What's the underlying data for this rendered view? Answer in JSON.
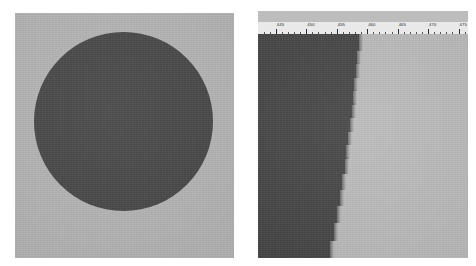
{
  "figure": {
    "title": "",
    "background_color": "#ffffff",
    "panel_count": 2
  },
  "panels": {
    "left": {
      "name": "circular-aperture-image",
      "background_color": "#b5b5b5",
      "shape": "circle",
      "shape_color": "#464646",
      "caption": ""
    },
    "right": {
      "name": "line-scan-profile-image",
      "background_color": "#bcbcbc",
      "dark_region_color": "#454545",
      "light_region_color": "#bcbcbc",
      "caption": ""
    }
  },
  "ruler": {
    "name": "horizontal-scale-bar",
    "background_color": "#e9e9e9",
    "tick_color": "#2e2e2e",
    "minor_ticks_per_major": 5,
    "major_ticks": [
      {
        "label": "445",
        "pos_pct": 8.5
      },
      {
        "label": "450",
        "pos_pct": 23.0
      },
      {
        "label": "455",
        "pos_pct": 37.5
      },
      {
        "label": "460",
        "pos_pct": 52.0
      },
      {
        "label": "465",
        "pos_pct": 66.5
      },
      {
        "label": "470",
        "pos_pct": 81.0
      },
      {
        "label": "475",
        "pos_pct": 95.5
      }
    ],
    "range_start": "445",
    "range_end": "475",
    "units": ""
  },
  "chart_data": {
    "type": "area",
    "title": "",
    "xlabel": "",
    "ylabel": "",
    "xlim": [
      443,
      477
    ],
    "ylim": [
      0,
      224
    ],
    "grid": false,
    "legend": "none",
    "categories": [
      "band-01",
      "band-02",
      "band-03",
      "band-04",
      "band-05",
      "band-06",
      "band-07",
      "band-08",
      "band-09",
      "band-10",
      "band-11",
      "band-12",
      "band-13",
      "band-14",
      "band-15"
    ],
    "series": [
      {
        "name": "boundary-position",
        "values": [
          48.0,
          47.2,
          46.6,
          45.9,
          45.2,
          44.6,
          43.9,
          43.0,
          42.1,
          41.2,
          40.2,
          39.1,
          37.8,
          36.2,
          34.2
        ]
      }
    ],
    "band_tops_pct": [
      0,
      7,
      13,
      19,
      25,
      31,
      37,
      43,
      49,
      55,
      62,
      69,
      76,
      84,
      92
    ],
    "band_heights_pct": [
      7,
      6,
      6,
      6,
      6,
      6,
      6,
      6,
      6,
      7,
      7,
      7,
      8,
      8,
      8
    ]
  }
}
